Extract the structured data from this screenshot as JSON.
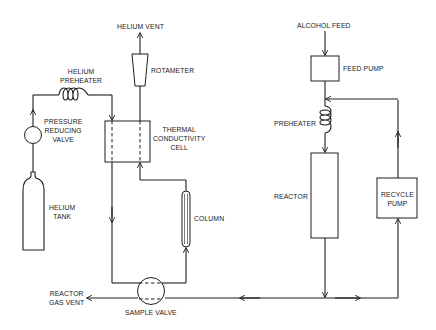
{
  "diagram": {
    "type": "process flow schematic"
  },
  "labels": {
    "helium_vent": "HELIUM VENT",
    "rotameter": "ROTAMETER",
    "helium_preheater": "HELIUM\nPREHEATER",
    "pressure_reducing_valve": "PRESSURE\nREDUCING\nVALVE",
    "thermal_conductivity_cell": "THERMAL\nCONDUCTIVITY\nCELL",
    "helium_tank": "HELIUM\nTANK",
    "column": "COLUMN",
    "reactor_gas_vent": "REACTOR\nGAS VENT",
    "sample_valve": "SAMPLE VALVE",
    "alcohol_feed": "ALCOHOL FEED",
    "feed_pump": "FEED PUMP",
    "preheater": "PREHEATER",
    "reactor": "REACTOR",
    "recycle_pump": "RECYCLE\nPUMP"
  },
  "components": [
    {
      "id": "helium-tank",
      "label": "HELIUM TANK",
      "shape": "gas cylinder"
    },
    {
      "id": "pressure-reducing-valve",
      "label": "PRESSURE REDUCING VALVE",
      "shape": "circle"
    },
    {
      "id": "helium-preheater",
      "label": "HELIUM PREHEATER",
      "shape": "horizontal coil"
    },
    {
      "id": "thermal-conductivity-cell",
      "label": "THERMAL CONDUCTIVITY CELL",
      "shape": "box with two dashed channels"
    },
    {
      "id": "rotameter",
      "label": "ROTAMETER",
      "shape": "tapered tube"
    },
    {
      "id": "helium-vent",
      "label": "HELIUM VENT",
      "shape": "outlet arrow"
    },
    {
      "id": "column",
      "label": "COLUMN",
      "shape": "slim rounded tube"
    },
    {
      "id": "sample-valve",
      "label": "SAMPLE VALVE",
      "shape": "circle with two dashed passages"
    },
    {
      "id": "reactor-gas-vent",
      "label": "REACTOR GAS VENT",
      "shape": "outlet arrow"
    },
    {
      "id": "alcohol-feed",
      "label": "ALCOHOL FEED",
      "shape": "inlet arrow"
    },
    {
      "id": "feed-pump",
      "label": "FEED PUMP",
      "shape": "box"
    },
    {
      "id": "preheater",
      "label": "PREHEATER",
      "shape": "vertical coil"
    },
    {
      "id": "reactor",
      "label": "REACTOR",
      "shape": "tall box"
    },
    {
      "id": "recycle-pump",
      "label": "RECYCLE PUMP",
      "shape": "box"
    }
  ],
  "connections": [
    {
      "from": "helium-tank",
      "to": "pressure-reducing-valve"
    },
    {
      "from": "pressure-reducing-valve",
      "to": "helium-preheater"
    },
    {
      "from": "helium-preheater",
      "to": "thermal-conductivity-cell",
      "note": "reference side"
    },
    {
      "from": "thermal-conductivity-cell",
      "to": "sample-valve",
      "note": "down left leg"
    },
    {
      "from": "sample-valve",
      "to": "column"
    },
    {
      "from": "column",
      "to": "thermal-conductivity-cell",
      "note": "sample side"
    },
    {
      "from": "thermal-conductivity-cell",
      "to": "rotameter"
    },
    {
      "from": "rotameter",
      "to": "helium-vent"
    },
    {
      "from": "alcohol-feed",
      "to": "feed-pump"
    },
    {
      "from": "feed-pump",
      "to": "preheater"
    },
    {
      "from": "preheater",
      "to": "reactor"
    },
    {
      "from": "reactor",
      "to": "bottom-header"
    },
    {
      "from": "bottom-header",
      "to": "sample-valve",
      "note": "leftward"
    },
    {
      "from": "sample-valve",
      "to": "reactor-gas-vent"
    },
    {
      "from": "bottom-header",
      "to": "recycle-pump",
      "note": "rightward"
    },
    {
      "from": "recycle-pump",
      "to": "preheater-inlet",
      "note": "recycle loop joins above preheater"
    }
  ],
  "colors": {
    "line": "#1e1e1e",
    "background": "#ffffff",
    "text": "#1a1a1a"
  }
}
